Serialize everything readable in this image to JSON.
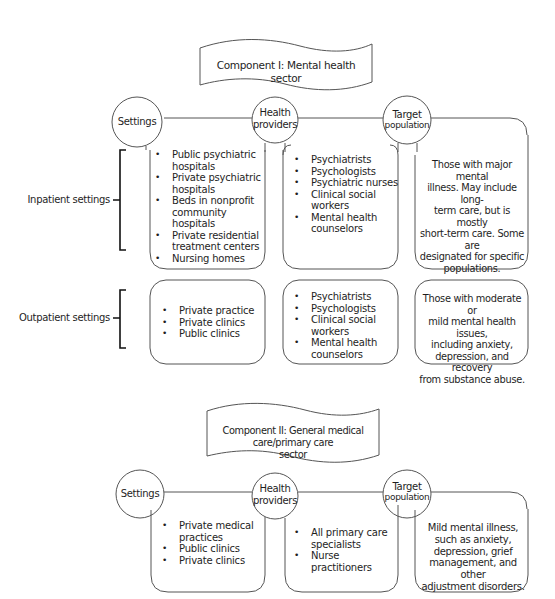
{
  "component_1": {
    "banner": "Component I: Mental health sector",
    "headers": {
      "settings": "Settings",
      "health_providers_line1": "Health",
      "health_providers_line2": "providers",
      "target_line1": "Target",
      "target_line2": "population"
    },
    "rows": [
      {
        "label": "Inpatient settings",
        "settings": [
          "Public psychiatric hospitals",
          "Private psychiatric hospitals",
          "Beds in nonprofit community hospitals",
          "Private residential treatment centers",
          "Nursing homes"
        ],
        "settings_lines": [
          [
            "Public psychiatric",
            "hospitals"
          ],
          [
            "Private psychiatric",
            "hospitals"
          ],
          [
            "Beds in nonprofit",
            "community hospitals"
          ],
          [
            "Private residential",
            "treatment centers"
          ],
          [
            "Nursing homes"
          ]
        ],
        "providers": [
          "Psychiatrists",
          "Psychologists",
          "Psychiatric nurses",
          "Clinical social workers",
          "Mental health counselors"
        ],
        "providers_lines": [
          [
            "Psychiatrists"
          ],
          [
            "Psychologists"
          ],
          [
            "Psychiatric nurses"
          ],
          [
            "Clinical social",
            "workers"
          ],
          [
            "Mental health",
            "counselors"
          ]
        ],
        "target": "Those with major mental illness. May include long-term care, but is mostly short-term care. Some are designated for specific populations.",
        "target_lines": [
          "Those with major mental",
          "illness. May include long-",
          "term care, but is mostly",
          "short-term care. Some are",
          "designated for specific",
          "populations."
        ]
      },
      {
        "label": "Outpatient settings",
        "settings": [
          "Private practice",
          "Private clinics",
          "Public clinics"
        ],
        "settings_lines": [
          [
            "Private practice"
          ],
          [
            "Private clinics"
          ],
          [
            "Public clinics"
          ]
        ],
        "providers": [
          "Psychiatrists",
          "Psychologists",
          "Clinical social workers",
          "Mental health counselors"
        ],
        "providers_lines": [
          [
            "Psychiatrists"
          ],
          [
            "Psychologists"
          ],
          [
            "Clinical social",
            "workers"
          ],
          [
            "Mental health",
            "counselors"
          ]
        ],
        "target": "Those with moderate or mild mental health issues, including anxiety, depression, and recovery from substance abuse.",
        "target_lines": [
          "Those with moderate or",
          "mild mental health issues,",
          "including anxiety,",
          "depression, and recovery",
          "from substance abuse."
        ]
      }
    ]
  },
  "component_2": {
    "banner_line1": "Component II: General medical care/primary care",
    "banner_line2": "sector",
    "headers": {
      "settings": "Settings",
      "health_providers_line1": "Health",
      "health_providers_line2": "providers",
      "target_line1": "Target",
      "target_line2": "population"
    },
    "settings": [
      "Private medical practices",
      "Public clinics",
      "Private clinics"
    ],
    "settings_lines": [
      [
        "Private medical",
        "practices"
      ],
      [
        "Public clinics"
      ],
      [
        "Private clinics"
      ]
    ],
    "providers": [
      "All primary care specialists",
      "Nurse practitioners"
    ],
    "providers_lines": [
      [
        "All primary care",
        "specialists"
      ],
      [
        "Nurse practitioners"
      ]
    ],
    "target": "Mild mental illness, such as anxiety, depression, grief management, and other adjustment disorders.",
    "target_lines": [
      "Mild mental illness,",
      "such as anxiety,",
      "depression, grief",
      "management, and other",
      "adjustment disorders."
    ]
  },
  "colors": {
    "stroke": "#555555",
    "bracket": "#111111",
    "text": "#1e1e1e",
    "background": "#ffffff"
  }
}
